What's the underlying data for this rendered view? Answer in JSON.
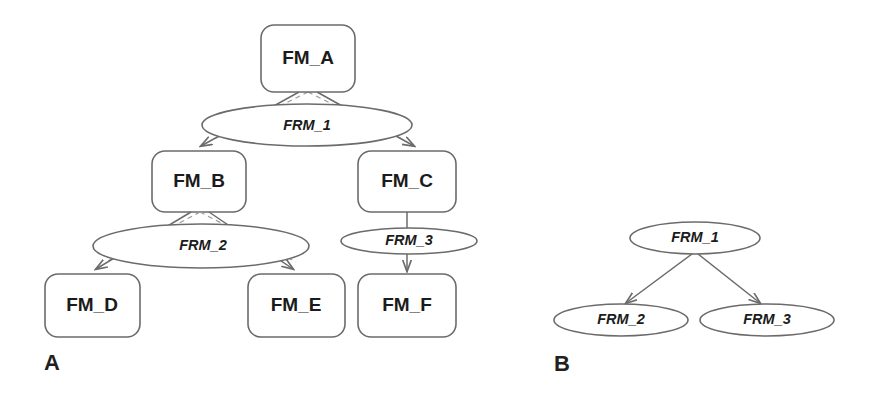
{
  "figure": {
    "width": 872,
    "height": 401,
    "background": "#ffffff",
    "stroke_color": "#6b6b6b",
    "dashed_stroke_color": "#9a9a9a",
    "text_color": "#1b1b1b"
  },
  "panels": [
    {
      "id": "panel-a",
      "label": "A",
      "label_x": 44,
      "label_y": 364,
      "nodes": [
        {
          "id": "fm_a",
          "label": "FM_A",
          "shape": "rounded-rect",
          "x": 261,
          "y": 25,
          "w": 94,
          "h": 67
        },
        {
          "id": "fm_b",
          "label": "FM_B",
          "shape": "rounded-rect",
          "x": 152,
          "y": 151,
          "w": 94,
          "h": 61
        },
        {
          "id": "fm_c",
          "label": "FM_C",
          "shape": "rounded-rect",
          "x": 358,
          "y": 151,
          "w": 98,
          "h": 61
        },
        {
          "id": "fm_d",
          "label": "FM_D",
          "shape": "rounded-rect",
          "x": 45,
          "y": 274,
          "w": 95,
          "h": 63
        },
        {
          "id": "fm_e",
          "label": "FM_E",
          "shape": "rounded-rect",
          "x": 248,
          "y": 274,
          "w": 97,
          "h": 63
        },
        {
          "id": "fm_f",
          "label": "FM_F",
          "shape": "rounded-rect",
          "x": 358,
          "y": 274,
          "w": 98,
          "h": 63
        }
      ],
      "relations": [
        {
          "id": "frm_1",
          "label": "FRM_1",
          "shape": "ellipse",
          "cx": 307,
          "cy": 125,
          "rx": 105,
          "ry": 21
        },
        {
          "id": "frm_2",
          "label": "FRM_2",
          "shape": "ellipse",
          "cx": 201,
          "cy": 246,
          "rx": 108,
          "ry": 22
        },
        {
          "id": "frm_3",
          "label": "FRM_3",
          "shape": "ellipse",
          "cx": 409,
          "cy": 241,
          "rx": 68,
          "ry": 13
        }
      ],
      "edges": [
        {
          "from": "fm_a",
          "to": "fm_b",
          "style": "solid",
          "arrow": true
        },
        {
          "from": "fm_a",
          "to": "fm_c",
          "style": "solid",
          "arrow": true
        },
        {
          "from": "fm_a",
          "to": "frm_1",
          "style": "dashed",
          "arrow": false
        },
        {
          "from": "fm_b",
          "to": "fm_d",
          "style": "solid",
          "arrow": true
        },
        {
          "from": "fm_b",
          "to": "fm_e",
          "style": "solid",
          "arrow": true
        },
        {
          "from": "fm_b",
          "to": "frm_2",
          "style": "dashed",
          "arrow": false
        },
        {
          "from": "fm_c",
          "to": "fm_f",
          "style": "solid",
          "arrow": true
        }
      ]
    },
    {
      "id": "panel-b",
      "label": "B",
      "label_x": 554,
      "label_y": 365,
      "nodes": [],
      "relations": [
        {
          "id": "frm_1_b",
          "label": "FRM_1",
          "shape": "ellipse",
          "cx": 695,
          "cy": 238,
          "rx": 65,
          "ry": 16
        },
        {
          "id": "frm_2_b",
          "label": "FRM_2",
          "shape": "ellipse",
          "cx": 621,
          "cy": 320,
          "rx": 67,
          "ry": 16
        },
        {
          "id": "frm_3_b",
          "label": "FRM_3",
          "shape": "ellipse",
          "cx": 767,
          "cy": 320,
          "rx": 67,
          "ry": 16
        }
      ],
      "edges": [
        {
          "from": "frm_1_b",
          "to": "frm_2_b",
          "style": "solid",
          "arrow": true
        },
        {
          "from": "frm_1_b",
          "to": "frm_3_b",
          "style": "solid",
          "arrow": true
        }
      ]
    }
  ]
}
